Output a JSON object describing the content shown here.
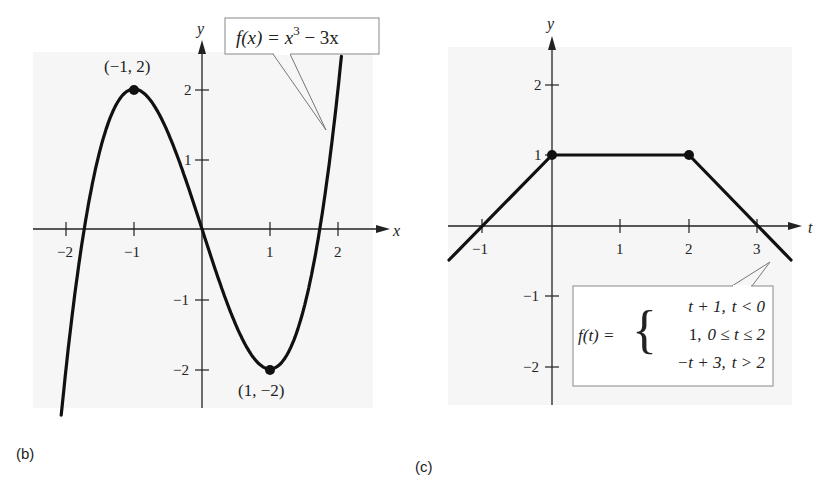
{
  "panels": {
    "b": {
      "caption": "(b)",
      "equation": "f(x) = x³ − 3x",
      "eq_parts": {
        "lhs": "f(x) = x",
        "exp": "3",
        "rest": " − 3x"
      },
      "x_axis_label": "x",
      "y_axis_label": "y",
      "x_ticks": [
        "−2",
        "−1",
        "1",
        "2"
      ],
      "y_ticks": [
        "2",
        "1",
        "−1",
        "−2"
      ],
      "points": [
        {
          "label": "(−1, 2)",
          "x": -1,
          "y": 2
        },
        {
          "label": "(1, −2)",
          "x": 1,
          "y": -2
        }
      ]
    },
    "c": {
      "caption": "(c)",
      "x_axis_label": "t",
      "y_axis_label": "y",
      "x_ticks": [
        "−1",
        "1",
        "2",
        "3"
      ],
      "y_ticks": [
        "2",
        "1",
        "−1",
        "−2"
      ],
      "equation_lhs": "f(t) =",
      "cases": [
        {
          "expr": "t + 1,",
          "cond": "t < 0"
        },
        {
          "expr": "1,",
          "cond": "0 ≤ t ≤ 2"
        },
        {
          "expr": "−t + 3,",
          "cond": "t > 2"
        }
      ],
      "points": [
        {
          "x": 0,
          "y": 1
        },
        {
          "x": 2,
          "y": 1
        }
      ]
    }
  },
  "chart_data": [
    {
      "type": "line",
      "title": "f(x) = x^3 - 3x",
      "xlabel": "x",
      "ylabel": "y",
      "xlim": [
        -2.5,
        2.8
      ],
      "ylim": [
        -2.5,
        2.6
      ],
      "x_ticks": [
        -2,
        -1,
        1,
        2
      ],
      "y_ticks": [
        -2,
        -1,
        1,
        2
      ],
      "grid": false,
      "series": [
        {
          "name": "f(x) = x^3 - 3x",
          "x": [
            -2.05,
            -2.0,
            -1.75,
            -1.5,
            -1.25,
            -1.0,
            -0.75,
            -0.5,
            -0.25,
            0,
            0.25,
            0.5,
            0.75,
            1.0,
            1.25,
            1.5,
            1.75,
            2.0,
            2.13
          ],
          "y": [
            -2.47,
            -2.0,
            -0.11,
            1.125,
            1.8,
            2.0,
            1.83,
            1.375,
            0.73,
            0,
            -0.73,
            -1.375,
            -1.83,
            -2.0,
            -1.8,
            -1.125,
            0.11,
            2.0,
            3.27
          ]
        }
      ],
      "annotations": [
        {
          "text": "(-1, 2)",
          "x": -1,
          "y": 2,
          "type": "relative maximum"
        },
        {
          "text": "(1, -2)",
          "x": 1,
          "y": -2,
          "type": "relative minimum"
        }
      ],
      "panel": "(b)"
    },
    {
      "type": "line",
      "title": "f(t) piecewise: t+1 (t<0); 1 (0≤t≤2); -t+3 (t>2)",
      "xlabel": "t",
      "ylabel": "y",
      "xlim": [
        -1.5,
        3.6
      ],
      "ylim": [
        -2.5,
        2.6
      ],
      "x_ticks": [
        -1,
        1,
        2,
        3
      ],
      "y_ticks": [
        -2,
        -1,
        1,
        2
      ],
      "grid": false,
      "series": [
        {
          "name": "f(t)",
          "x": [
            -1.5,
            -1,
            0,
            2,
            3,
            3.5
          ],
          "y": [
            -0.5,
            0,
            1,
            1,
            0,
            -0.5
          ]
        }
      ],
      "annotations": [
        {
          "text": "point",
          "x": 0,
          "y": 1
        },
        {
          "text": "point",
          "x": 2,
          "y": 1
        }
      ],
      "panel": "(c)"
    }
  ]
}
